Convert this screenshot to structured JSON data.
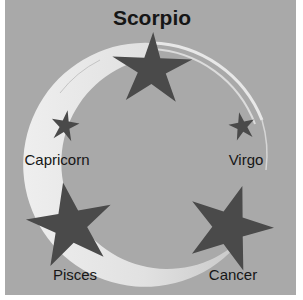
{
  "diagram": {
    "title": "Scorpio",
    "colors": {
      "background": "#a9a9a9",
      "ring": "#e6e6e6",
      "star": "#4a4a4a",
      "text": "#161616"
    },
    "nodes": [
      {
        "id": "scorpio",
        "label": "Scorpio",
        "icon": "star-icon",
        "size": "large",
        "position": "top"
      },
      {
        "id": "capricorn",
        "label": "Capricorn",
        "icon": "star-icon",
        "size": "small",
        "position": "upper-left"
      },
      {
        "id": "virgo",
        "label": "Virgo",
        "icon": "star-icon",
        "size": "small",
        "position": "upper-right"
      },
      {
        "id": "pisces",
        "label": "Pisces",
        "icon": "star-icon",
        "size": "large",
        "position": "lower-left"
      },
      {
        "id": "cancer",
        "label": "Cancer",
        "icon": "star-icon",
        "size": "large",
        "position": "lower-right"
      }
    ],
    "connector": "circular-ring"
  }
}
